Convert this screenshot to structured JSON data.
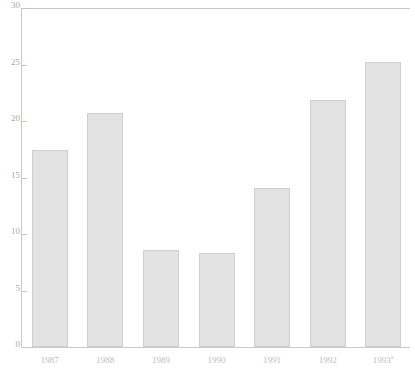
{
  "chart_data": {
    "type": "bar",
    "title": "",
    "xlabel": "",
    "ylabel": "",
    "categories": [
      "1987",
      "1988",
      "1989",
      "1990",
      "1991",
      "1992",
      "1993"
    ],
    "category_superscripts": [
      "",
      "",
      "",
      "",
      "",
      "",
      "a"
    ],
    "values": [
      17.4,
      20.7,
      8.6,
      8.3,
      14.1,
      21.9,
      25.2
    ],
    "ylim": [
      0,
      30
    ],
    "yticks": [
      0,
      5,
      10,
      15,
      20,
      25,
      30
    ],
    "ytick_labels": [
      "0",
      "5",
      "10",
      "15",
      "20",
      "25",
      "30"
    ],
    "grid": false,
    "legend": null,
    "bar_fill_color": "#e3e3e3",
    "bar_edge_color": "#cfcfcf",
    "axis_color": "#c8c8c8",
    "text_color": "#b0b0b0"
  }
}
